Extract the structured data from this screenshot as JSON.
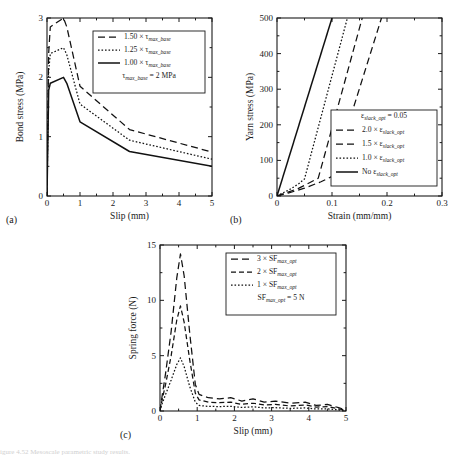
{
  "figure": {
    "panel_labels": {
      "a": "(a)",
      "b": "(b)",
      "c": "(c)"
    },
    "caption_faint": "igure 4.52 Mesoscale parametric study results."
  },
  "chart_data": [
    {
      "type": "line",
      "panel": "(a)",
      "title": "",
      "xlabel": "Slip (mm)",
      "ylabel": "Bond stress (MPa)",
      "xlim": [
        0,
        5
      ],
      "ylim": [
        0,
        3
      ],
      "xticks": [
        0,
        1,
        2,
        3,
        4,
        5
      ],
      "xticklabels": [
        "0",
        "1",
        "2",
        "3",
        "4",
        "5"
      ],
      "yticks": [
        0,
        1,
        2,
        3
      ],
      "yticklabels": [
        "0",
        "1",
        "2",
        "3"
      ],
      "minor_xticks": [
        0.5,
        1.5,
        2.5,
        3.5,
        4.5
      ],
      "minor_yticks": [
        0.5,
        1.5,
        2.5
      ],
      "grid": false,
      "legend_position": "upper-right",
      "annotation": "τmax_base = 2 MPa",
      "series": [
        {
          "name": "1.50 × τmax_base",
          "dash": "long",
          "x": [
            0,
            0.05,
            0.1,
            0.5,
            0.6,
            1.0,
            2.5,
            5.0
          ],
          "y": [
            0,
            2.4,
            2.85,
            3.0,
            2.85,
            1.85,
            1.12,
            0.74
          ]
        },
        {
          "name": "1.25 × τmax_base",
          "dash": "short",
          "x": [
            0,
            0.05,
            0.1,
            0.5,
            0.6,
            1.0,
            2.5,
            5.0
          ],
          "y": [
            0,
            2.1,
            2.4,
            2.5,
            2.38,
            1.55,
            0.94,
            0.62
          ]
        },
        {
          "name": "1.00 × τmax_base",
          "dash": "solid",
          "x": [
            0,
            0.05,
            0.1,
            0.5,
            0.6,
            1.0,
            2.5,
            5.0
          ],
          "y": [
            0,
            1.78,
            1.9,
            2.0,
            1.9,
            1.25,
            0.75,
            0.5
          ]
        }
      ]
    },
    {
      "type": "line",
      "panel": "(b)",
      "title": "",
      "xlabel": "Strain (mm/mm)",
      "ylabel": "Yarn stress (MPa)",
      "xlim": [
        0,
        0.3
      ],
      "ylim": [
        0,
        500
      ],
      "xticks": [
        0,
        0.1,
        0.2,
        0.3
      ],
      "xticklabels": [
        "0",
        "0.1",
        "0.2",
        "0.3"
      ],
      "yticks": [
        0,
        100,
        200,
        300,
        400,
        500
      ],
      "yticklabels": [
        "0",
        "100",
        "200",
        "300",
        "400",
        "500"
      ],
      "minor_xticks": [
        0.05,
        0.15,
        0.25
      ],
      "minor_yticks": [
        50,
        150,
        250,
        350,
        450
      ],
      "grid": false,
      "legend_position": "lower-right",
      "annotation": "εslack_opt = 0.05",
      "series": [
        {
          "name": "2.0 × εslack_opt",
          "dash": "long",
          "x": [
            0,
            0.02,
            0.05,
            0.08,
            0.1,
            0.19
          ],
          "y": [
            0,
            8,
            22,
            40,
            55,
            500
          ]
        },
        {
          "name": "1.5 × εslack_opt",
          "dash": "long",
          "x": [
            0,
            0.015,
            0.04,
            0.06,
            0.075,
            0.155
          ],
          "y": [
            0,
            8,
            22,
            38,
            50,
            500
          ]
        },
        {
          "name": "1.0 × εslack_opt",
          "dash": "short",
          "x": [
            0,
            0.01,
            0.025,
            0.04,
            0.05,
            0.128
          ],
          "y": [
            0,
            8,
            20,
            35,
            48,
            500
          ]
        },
        {
          "name": "No εslack_opt",
          "dash": "solid",
          "x": [
            0,
            0.1
          ],
          "y": [
            0,
            500
          ]
        }
      ]
    },
    {
      "type": "line",
      "panel": "(c)",
      "title": "",
      "xlabel": "Slip (mm)",
      "ylabel": "Spring force (N)",
      "xlim": [
        0,
        5
      ],
      "ylim": [
        0,
        15
      ],
      "xticks": [
        0,
        1,
        2,
        3,
        4,
        5
      ],
      "xticklabels": [
        "0",
        "1",
        "2",
        "3",
        "4",
        "5"
      ],
      "yticks": [
        0,
        5,
        10,
        15
      ],
      "yticklabels": [
        "0",
        "5",
        "10",
        "15"
      ],
      "minor_xticks": [
        0.5,
        1.5,
        2.5,
        3.5,
        4.5
      ],
      "minor_yticks": [
        2.5,
        7.5,
        12.5
      ],
      "grid": false,
      "legend_position": "upper-right",
      "annotation": "SFmax_opt = 5 N",
      "series": [
        {
          "name": "3 × SFmax_opt",
          "dash": "long",
          "peak": 14.2,
          "peak_x": 0.55,
          "x": [
            0,
            0.05,
            0.15,
            0.3,
            0.45,
            0.55,
            0.65,
            0.8,
            0.95,
            1.05,
            1.3,
            1.6,
            1.9,
            2.2,
            2.5,
            2.8,
            3.1,
            3.5,
            3.9,
            4.2,
            4.5,
            4.8,
            5.0
          ],
          "y": [
            0,
            1.2,
            3.4,
            7.2,
            12.0,
            14.2,
            12.2,
            7.0,
            2.4,
            1.5,
            1.2,
            1.1,
            1.2,
            0.9,
            1.1,
            0.8,
            0.9,
            0.7,
            0.8,
            0.5,
            0.6,
            0.3,
            0.1
          ]
        },
        {
          "name": "2 × SFmax_opt",
          "dash": "medium",
          "peak": 9.5,
          "peak_x": 0.55,
          "x": [
            0,
            0.05,
            0.15,
            0.3,
            0.45,
            0.55,
            0.65,
            0.8,
            0.95,
            1.05,
            1.3,
            1.6,
            1.9,
            2.2,
            2.5,
            2.8,
            3.1,
            3.5,
            3.9,
            4.2,
            4.5,
            4.8,
            5.0
          ],
          "y": [
            0,
            0.9,
            2.4,
            5.0,
            8.2,
            9.5,
            8.0,
            4.6,
            1.6,
            1.0,
            0.8,
            0.75,
            0.8,
            0.6,
            0.7,
            0.55,
            0.6,
            0.45,
            0.55,
            0.35,
            0.4,
            0.2,
            0.08
          ]
        },
        {
          "name": "1 × SFmax_opt",
          "dash": "short",
          "peak": 4.8,
          "peak_x": 0.55,
          "x": [
            0,
            0.05,
            0.15,
            0.3,
            0.45,
            0.55,
            0.65,
            0.8,
            0.95,
            1.05,
            1.3,
            1.6,
            1.9,
            2.2,
            2.5,
            2.8,
            3.1,
            3.5,
            3.9,
            4.2,
            4.5,
            4.8,
            5.0
          ],
          "y": [
            0,
            0.6,
            1.5,
            2.8,
            4.2,
            4.8,
            4.0,
            2.2,
            0.8,
            0.5,
            0.42,
            0.4,
            0.42,
            0.32,
            0.38,
            0.28,
            0.3,
            0.24,
            0.28,
            0.18,
            0.2,
            0.1,
            0.04
          ]
        }
      ]
    }
  ]
}
